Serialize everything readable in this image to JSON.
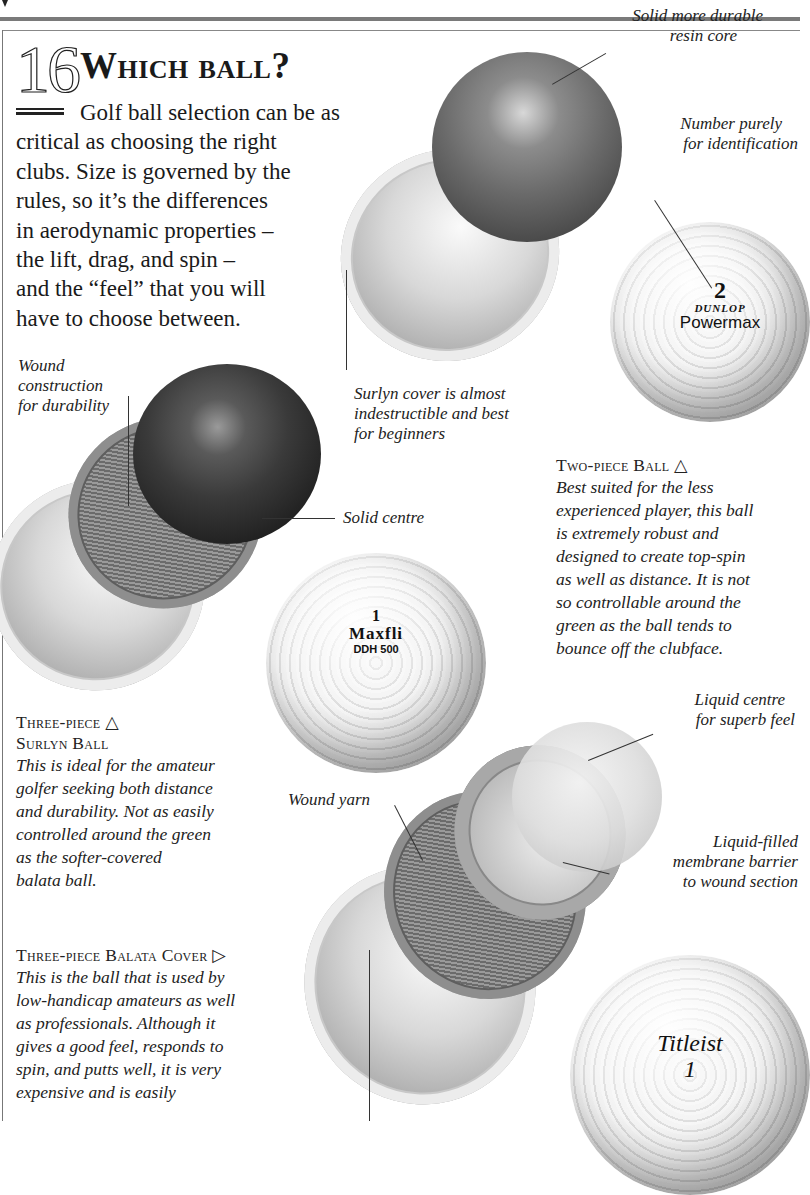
{
  "page": {
    "section_number": "16",
    "title": "Which ball?",
    "intro": {
      "line1": "Golf ball selection can be as",
      "rest": [
        "critical as choosing the right",
        "clubs. Size is governed by the",
        "rules, so it’s the differences",
        "in aerodynamic properties –",
        "the lift, drag, and spin –",
        "and the “feel” that you will",
        "have to choose between."
      ]
    }
  },
  "callouts": {
    "solid_core": [
      "Solid more durable",
      "resin core"
    ],
    "number_id": [
      "Number purely",
      "for identification"
    ],
    "surlyn_cover": [
      "Surlyn cover is almost",
      "indestructible and best",
      "for beginners"
    ],
    "wound_construction": [
      "Wound",
      "construction",
      "for durability"
    ],
    "solid_centre": "Solid centre",
    "liquid_centre": [
      "Liquid centre",
      "for superb feel"
    ],
    "wound_yarn": "Wound yarn",
    "membrane": [
      "Liquid-filled",
      "membrane barrier",
      "to wound section"
    ]
  },
  "balls": {
    "two_piece": {
      "heading": "Two-piece Ball",
      "arrow": "△",
      "body": [
        "Best suited for the less",
        "experienced player, this ball",
        "is extremely robust and",
        "designed to create top-spin",
        "as well as distance. It is not",
        "so controllable around the",
        "green as the ball tends to",
        "bounce off the clubface."
      ],
      "print": {
        "number": "2",
        "brand": "DUNLOP",
        "model": "Powermax"
      }
    },
    "three_piece_surlyn": {
      "heading_line1": "Three-piece",
      "arrow": "△",
      "heading_line2": "Surlyn Ball",
      "body": [
        "This is ideal for the amateur",
        "golfer seeking both distance",
        "and durability. Not as easily",
        "controlled around the green",
        "as the softer-covered",
        "balata ball."
      ],
      "print": {
        "number": "1",
        "brand": "Maxfli",
        "model": "DDH 500"
      }
    },
    "three_piece_balata": {
      "heading": "Three-piece Balata Cover",
      "arrow": "▷",
      "body": [
        "This is the ball that is used by",
        "low-handicap amateurs as well",
        "as professionals. Although it",
        "gives a good feel, responds to",
        "spin, and putts well, it is very",
        "expensive and is easily"
      ],
      "print": {
        "brand": "Titleist",
        "number": "1"
      }
    }
  }
}
